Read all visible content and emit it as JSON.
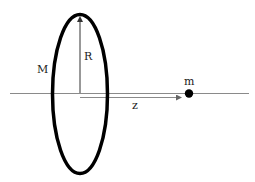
{
  "diagram": {
    "type": "physics-ring-point-mass",
    "labels": {
      "ring_mass": "M",
      "radius": "R",
      "point_mass": "m",
      "distance": "z"
    },
    "colors": {
      "ring": "#000000",
      "axis": "#8a8a8a",
      "arrow": "#333333",
      "point_mass": "#000000",
      "text": "#222222",
      "background": "#ffffff"
    }
  }
}
